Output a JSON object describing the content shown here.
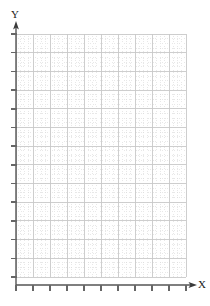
{
  "chart_data": {
    "type": "scatter",
    "title": "",
    "subtitle": "",
    "xlabel": "X",
    "ylabel": "Y",
    "series": [
      {
        "name": "",
        "x": [],
        "y": []
      }
    ],
    "x": [],
    "values": [],
    "categories": [],
    "xlim": [
      0,
      10
    ],
    "ylim": [
      0,
      13
    ],
    "xticklabels": [],
    "yticklabels": [],
    "x_major_ticks": 10,
    "y_major_ticks": 13,
    "minor_per_major_x": 3,
    "minor_per_major_y": 3,
    "grid": true,
    "grid_style": "major-solid-minor-dotted",
    "legend": false,
    "legend_position": "none",
    "annotations": [],
    "note": "Empty graph-paper style blank Cartesian plot; no data points plotted"
  },
  "axes": {
    "y": {
      "label": "Y",
      "icon": "arrow-up-icon",
      "tick_count": 13,
      "origin_px": 285,
      "top_px": 26
    },
    "x": {
      "label": "X",
      "icon": "arrow-right-icon",
      "tick_count": 10,
      "origin_px": 16,
      "end_px": 192
    }
  },
  "colors": {
    "axis": "#555555",
    "major_grid": "#c9c9c9",
    "minor_grid": "#d9d9d9",
    "tick": "#666666",
    "label_text": "#1a1a1a",
    "background": "#ffffff"
  },
  "plot_area": {
    "left": 16,
    "top": 34,
    "right": 186,
    "bottom": 277,
    "width": 170,
    "height": 243
  }
}
